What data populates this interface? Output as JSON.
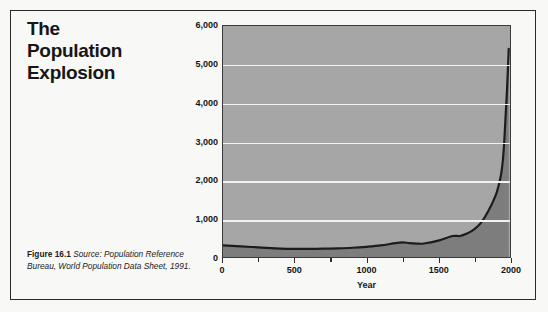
{
  "figure": {
    "title_lines": [
      "The",
      "Population",
      "Explosion"
    ],
    "caption_figure_number": "Figure 16.1",
    "caption_source": "Source: Population Reference Bureau, World Population Data Sheet, 1991."
  },
  "chart_data": {
    "type": "area",
    "title": "The Population Explosion",
    "xlabel": "Year",
    "ylabel": "World Population (in Millions)",
    "xlim": [
      0,
      2000
    ],
    "ylim": [
      0,
      6000
    ],
    "grid": true,
    "legend": false,
    "x_ticks": [
      0,
      500,
      1000,
      1500,
      2000
    ],
    "x_tick_labels": [
      "0",
      "500",
      "1000",
      "1500",
      "2000"
    ],
    "x_minor_tick_interval": 250,
    "y_ticks": [
      0,
      1000,
      2000,
      3000,
      4000,
      5000,
      6000
    ],
    "y_tick_labels": [
      "0",
      "1,000",
      "2,000",
      "3,000",
      "4,000",
      "5,000",
      "6,000"
    ],
    "x": [
      0,
      200,
      400,
      500,
      600,
      700,
      800,
      900,
      1000,
      1100,
      1200,
      1250,
      1300,
      1350,
      1400,
      1500,
      1600,
      1650,
      1700,
      1750,
      1800,
      1850,
      1900,
      1920,
      1930,
      1940,
      1950,
      1960,
      1970,
      1980,
      1990,
      1991
    ],
    "y": [
      300,
      260,
      220,
      210,
      210,
      215,
      225,
      240,
      265,
      300,
      360,
      380,
      360,
      350,
      350,
      425,
      545,
      545,
      610,
      720,
      900,
      1200,
      1600,
      1850,
      2000,
      2200,
      2500,
      3000,
      3700,
      4400,
      5300,
      5400
    ],
    "series_name": "World population",
    "colors": {
      "plot_background": "#a6a6a6",
      "gridline": "#f2f2f0",
      "area_fill": "#7d7d7d",
      "curve_line": "#1c1c1c",
      "frame": "#3a3a3a",
      "page_background": "#f8f8f7",
      "text": "#151515"
    }
  }
}
